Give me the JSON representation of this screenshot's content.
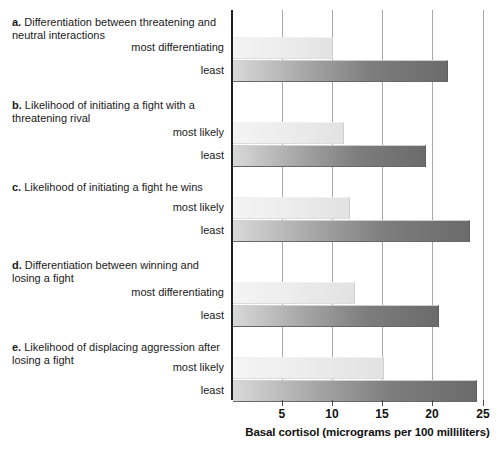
{
  "chart_data": {
    "type": "bar",
    "orientation": "horizontal",
    "title": "",
    "xlabel": "Basal cortisol (micrograms per 100 milliliters)",
    "ylabel": "",
    "xlim": [
      0,
      25
    ],
    "xticks": [
      5,
      10,
      15,
      20,
      25
    ],
    "xtick_labels": [
      "5",
      "10",
      "15",
      "20",
      "25"
    ],
    "grid": true,
    "legend": "none",
    "groups": [
      {
        "letter": "a.",
        "title": "Differentiation between threatening and neutral interactions",
        "categories": [
          "most differentiating",
          "least"
        ],
        "values": [
          9.9,
          21.3
        ],
        "styles": [
          "light",
          "dark"
        ]
      },
      {
        "letter": "b.",
        "title": "Likelihood of initiating a fight with a threatening rival",
        "categories": [
          "most likely",
          "least"
        ],
        "values": [
          10.9,
          19.1
        ],
        "styles": [
          "light",
          "dark"
        ]
      },
      {
        "letter": "c.",
        "title": "Likelihood of initiating a fight he wins",
        "categories": [
          "most likely",
          "least"
        ],
        "values": [
          11.5,
          23.5
        ],
        "styles": [
          "light",
          "dark"
        ]
      },
      {
        "letter": "d.",
        "title": "Differentiation between winning and losing a fight",
        "categories": [
          "most differentiating",
          "least"
        ],
        "values": [
          12.0,
          20.4
        ],
        "styles": [
          "light",
          "dark"
        ]
      },
      {
        "letter": "e.",
        "title": "Likelihood of displacing aggression after losing a fight",
        "categories": [
          "most likely",
          "least"
        ],
        "values": [
          14.9,
          24.2
        ],
        "styles": [
          "light",
          "dark"
        ]
      }
    ],
    "colors": {
      "light_bar_start": "#f4f4f4",
      "light_bar_end": "#e2e2e2",
      "dark_bar_start": "#d9d9d9",
      "dark_bar_end": "#6b6b6b",
      "axis": "#1f1f1f",
      "gridline": "#a8a8a8",
      "text": "#1a1a1a",
      "background": "#ffffff"
    }
  },
  "geometry": {
    "axis_x0": 232,
    "px_per_unit": 10.05,
    "plot_top": 10,
    "plot_bottom": 400,
    "bar_height": 20,
    "group_tops": [
      37,
      122,
      197,
      282,
      357
    ]
  }
}
